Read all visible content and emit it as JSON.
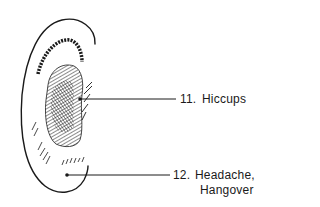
{
  "diagram": {
    "points": [
      {
        "number": "11.",
        "label": "Hiccups"
      },
      {
        "number": "12.",
        "label": "Headache,",
        "label_line2": "Hangover"
      }
    ]
  },
  "colors": {
    "ink": "#1a1a1a",
    "background": "#ffffff"
  }
}
